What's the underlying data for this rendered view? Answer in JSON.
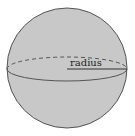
{
  "diagram": {
    "shape": "sphere",
    "label": "radius",
    "colors": {
      "fill": "#c8c8c8",
      "stroke": "#555555",
      "background": "#ffffff"
    }
  }
}
